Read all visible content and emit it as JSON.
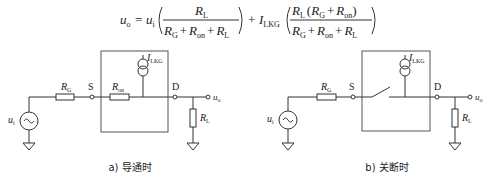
{
  "formula": {
    "lhs": "u",
    "lhs_sub": "o",
    "eq": "=",
    "term1_coef": "u",
    "term1_coef_sub": "i",
    "term1_num": "R",
    "term1_num_sub": "L",
    "term1_den": [
      "R",
      "G",
      "+",
      "R",
      "on",
      "+",
      "R",
      "L"
    ],
    "plus": "+",
    "term2_coef": "I",
    "term2_coef_sub": "LKG",
    "term2_num": [
      "R",
      "L",
      "(",
      "R",
      "G",
      "+",
      "R",
      "on",
      ")"
    ],
    "term2_den": [
      "R",
      "G",
      "+",
      "R",
      "on",
      "+",
      "R",
      "L"
    ]
  },
  "panels": [
    {
      "caption": "a) 导通时",
      "source_label": "u",
      "source_label_sub": "i",
      "rg_label": "R",
      "rg_sub": "G",
      "s_label": "S",
      "d_label": "D",
      "ron_label": "R",
      "ron_sub": "on",
      "ilkg_label": "I",
      "ilkg_sub": "LKG",
      "rl_label": "R",
      "rl_sub": "L",
      "out_label": "u",
      "out_sub": "o",
      "switch_state": "on"
    },
    {
      "caption": "b) 关断时",
      "source_label": "u",
      "source_label_sub": "i",
      "rg_label": "R",
      "rg_sub": "G",
      "s_label": "S",
      "d_label": "D",
      "ilkg_label": "I",
      "ilkg_sub": "LKG",
      "rl_label": "R",
      "rl_sub": "L",
      "out_label": "u",
      "out_sub": "o",
      "switch_state": "off"
    }
  ]
}
